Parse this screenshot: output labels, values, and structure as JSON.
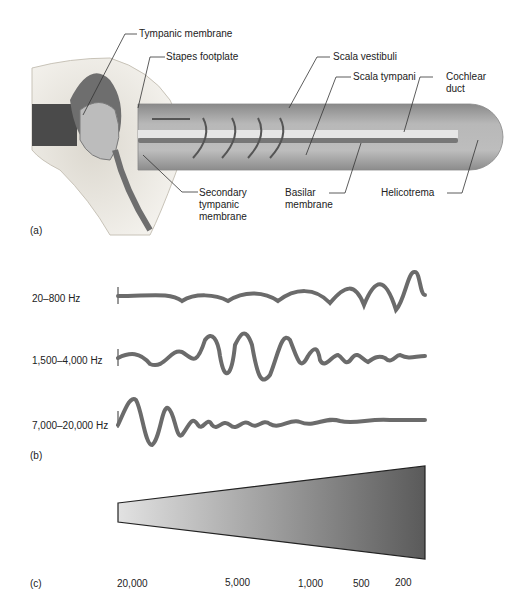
{
  "panel_a": {
    "letter": "(a)",
    "labels": {
      "tympanic_membrane": "Tympanic membrane",
      "stapes_footplate": "Stapes footplate",
      "scala_vestibuli": "Scala vestibuli",
      "scala_tympani": "Scala tympani",
      "cochlear_duct_1": "Cochlear",
      "cochlear_duct_2": "duct",
      "secondary_1": "Secondary",
      "secondary_2": "tympanic",
      "secondary_3": "membrane",
      "basilar_1": "Basilar",
      "basilar_2": "membrane",
      "helicotrema": "Helicotrema"
    }
  },
  "panel_b": {
    "letter": "(b)",
    "waves": [
      {
        "label": "20–800 Hz"
      },
      {
        "label": "1,500–4,000 Hz"
      },
      {
        "label": "7,000–20,000 Hz"
      }
    ]
  },
  "panel_c": {
    "letter": "(c)",
    "ticks": [
      "20,000",
      "5,000",
      "1,000",
      "500",
      "200"
    ]
  },
  "colors": {
    "wave": "#6b6b6b",
    "tube": "#9a9a9a",
    "bone": "#d8d4cc"
  }
}
